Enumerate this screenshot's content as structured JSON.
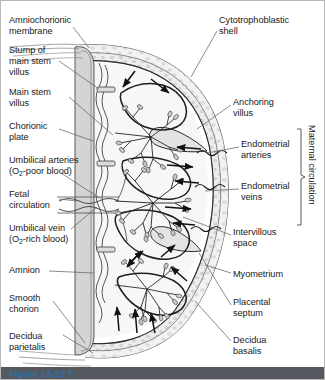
{
  "figure": {
    "caption": "Figure 13-22 T",
    "caption_color": "#2f6fae"
  },
  "labels_left": [
    {
      "id": "amniochorionic-membrane",
      "text": "Amniochorionic\nmembrane",
      "x": 8,
      "y": 14
    },
    {
      "id": "stump-main-stem-villus",
      "text": "Stump of\nmain stem\nvillus",
      "x": 8,
      "y": 44
    },
    {
      "id": "main-stem-villus",
      "text": "Main stem\nvillus",
      "x": 8,
      "y": 86
    },
    {
      "id": "chorionic-plate",
      "text": "Chorionic\nplate",
      "x": 8,
      "y": 120
    },
    {
      "id": "umbilical-arteries",
      "text": "Umbilical arteries",
      "x": 8,
      "y": 154
    },
    {
      "id": "fetal-circulation",
      "text": "Fetal\ncirculation",
      "x": 8,
      "y": 188
    },
    {
      "id": "umbilical-vein",
      "text": "Umbilical vein",
      "x": 8,
      "y": 222
    },
    {
      "id": "amnion",
      "text": "Amnion",
      "x": 8,
      "y": 264
    },
    {
      "id": "smooth-chorion",
      "text": "Smooth\nchorion",
      "x": 8,
      "y": 292
    },
    {
      "id": "decidua-parietalis",
      "text": "Decidua\nparietalis",
      "x": 8,
      "y": 330
    }
  ],
  "labels_left_sub": [
    {
      "id": "umbilical-arteries-detail",
      "pre": "(O",
      "sub": "2",
      "post": "-poor blood)",
      "x": 8,
      "y": 165
    },
    {
      "id": "umbilical-vein-detail",
      "pre": "(O",
      "sub": "2",
      "post": "-rich blood)",
      "x": 8,
      "y": 233
    }
  ],
  "labels_right": [
    {
      "id": "cytotrophoblastic-shell",
      "text": "Cytotrophoblastic\nshell",
      "x": 218,
      "y": 14
    },
    {
      "id": "anchoring-villus",
      "text": "Anchoring\nvillus",
      "x": 232,
      "y": 96
    },
    {
      "id": "endometrial-arteries",
      "text": "Endometrial\narteries",
      "x": 240,
      "y": 138
    },
    {
      "id": "endometrial-veins",
      "text": "Endometrial\nveins",
      "x": 240,
      "y": 180
    },
    {
      "id": "intervillous-space",
      "text": "Intervillous\nspace",
      "x": 232,
      "y": 226
    },
    {
      "id": "myometrium",
      "text": "Myometrium",
      "x": 232,
      "y": 268
    },
    {
      "id": "placental-septum",
      "text": "Placental\nseptum",
      "x": 232,
      "y": 296
    },
    {
      "id": "decidua-basalis",
      "text": "Decidua\nbasalis",
      "x": 232,
      "y": 334
    }
  ],
  "bracket_label": {
    "id": "maternal-circulation",
    "text": "Maternal circulation",
    "x": 316,
    "y": 124
  },
  "colors": {
    "ink": "#1a1a1a",
    "line": "#3a3a3a",
    "wall_fill": "#e9e9e9",
    "plate_fill": "#d2d2d2",
    "space_fill": "#f6f6f6",
    "villus_fill": "#cfcfcf",
    "caption_bar": "#55585e",
    "border": "#b8b8b8"
  }
}
